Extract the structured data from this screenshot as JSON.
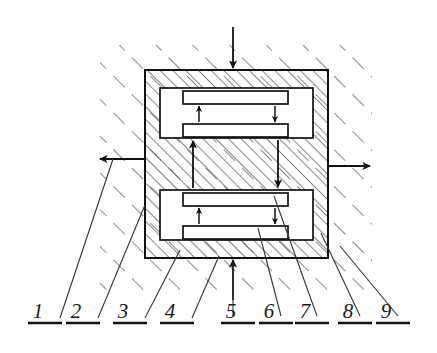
{
  "figure": {
    "type": "technical-cross-section-diagram",
    "background_color": "#ffffff",
    "line_color": "#1a1a1a",
    "hatch_color": "#555555"
  },
  "callouts": [
    {
      "id": "1",
      "label": "1",
      "text_x": 38,
      "text_y": 318,
      "rule_x1": 28,
      "rule_x2": 62,
      "rule_y": 323,
      "leader_x1": 60,
      "leader_y1": 318,
      "leader_x2": 113,
      "leader_y2": 159
    },
    {
      "id": "2",
      "label": "2",
      "text_x": 76,
      "text_y": 318,
      "rule_x1": 66,
      "rule_x2": 100,
      "rule_y": 323,
      "leader_x1": 98,
      "leader_y1": 318,
      "leader_x2": 145,
      "leader_y2": 205
    },
    {
      "id": "3",
      "label": "3",
      "text_x": 123,
      "text_y": 318,
      "rule_x1": 113,
      "rule_x2": 147,
      "rule_y": 323,
      "leader_x1": 145,
      "leader_y1": 318,
      "leader_x2": 180,
      "leader_y2": 250
    },
    {
      "id": "4",
      "label": "4",
      "text_x": 170,
      "text_y": 318,
      "rule_x1": 160,
      "rule_x2": 194,
      "rule_y": 323,
      "leader_x1": 192,
      "leader_y1": 318,
      "leader_x2": 219,
      "leader_y2": 256
    },
    {
      "id": "5",
      "label": "5",
      "text_x": 231,
      "text_y": 318,
      "rule_x1": 221,
      "rule_x2": 255,
      "rule_y": 323,
      "leader_x1": 233,
      "leader_y1": 316,
      "leader_x2": 233,
      "leader_y2": 262
    },
    {
      "id": "6",
      "label": "6",
      "text_x": 269,
      "text_y": 318,
      "rule_x1": 259,
      "rule_x2": 293,
      "rule_y": 323,
      "leader_x1": 281,
      "leader_y1": 316,
      "leader_x2": 258,
      "leader_y2": 228
    },
    {
      "id": "7",
      "label": "7",
      "text_x": 305,
      "text_y": 318,
      "rule_x1": 295,
      "rule_x2": 329,
      "rule_y": 323,
      "leader_x1": 317,
      "leader_y1": 316,
      "leader_x2": 274,
      "leader_y2": 196
    },
    {
      "id": "8",
      "label": "8",
      "text_x": 348,
      "text_y": 318,
      "rule_x1": 338,
      "rule_x2": 372,
      "rule_y": 323,
      "leader_x1": 360,
      "leader_y1": 316,
      "leader_x2": 321,
      "leader_y2": 233
    },
    {
      "id": "9",
      "label": "9",
      "text_x": 386,
      "text_y": 318,
      "rule_x1": 376,
      "rule_x2": 410,
      "rule_y": 323,
      "leader_x1": 398,
      "leader_y1": 316,
      "leader_x2": 340,
      "leader_y2": 246
    }
  ],
  "housing": {
    "outer": {
      "x": 145,
      "y": 70,
      "width": 183,
      "height": 188
    },
    "wall_thickness": 15
  },
  "chambers": [
    {
      "name": "upper-chamber",
      "cavity": {
        "x": 160,
        "y": 88,
        "width": 153,
        "height": 50
      },
      "plates": [
        {
          "name": "upper-chamber-top-plate",
          "x": 183,
          "y": 91,
          "width": 105,
          "height": 13
        },
        {
          "name": "upper-chamber-bottom-plate",
          "x": 183,
          "y": 124,
          "width": 105,
          "height": 13
        }
      ],
      "internal_arrows": [
        {
          "name": "upper-chamber-up-arrow",
          "x": 199,
          "y_from": 122,
          "y_to": 106,
          "direction": "up"
        },
        {
          "name": "upper-chamber-down-arrow",
          "x": 275,
          "y_from": 106,
          "y_to": 122,
          "direction": "down"
        }
      ]
    },
    {
      "name": "lower-chamber",
      "cavity": {
        "x": 160,
        "y": 190,
        "width": 153,
        "height": 50
      },
      "plates": [
        {
          "name": "lower-chamber-top-plate",
          "x": 183,
          "y": 193,
          "width": 105,
          "height": 13
        },
        {
          "name": "lower-chamber-bottom-plate",
          "x": 183,
          "y": 226,
          "width": 105,
          "height": 13
        }
      ],
      "internal_arrows": [
        {
          "name": "lower-chamber-up-arrow",
          "x": 199,
          "y_from": 224,
          "y_to": 208,
          "direction": "up"
        },
        {
          "name": "lower-chamber-down-arrow",
          "x": 275,
          "y_from": 208,
          "y_to": 224,
          "direction": "down"
        }
      ]
    }
  ],
  "flow_arrows": [
    {
      "name": "inlet-arrow-top",
      "direction": "down",
      "x": 233,
      "y_from": 27,
      "y_to": 68
    },
    {
      "name": "inlet-arrow-bottom",
      "direction": "up",
      "x": 233,
      "y_from": 300,
      "y_to": 260
    },
    {
      "name": "outlet-arrow-left",
      "direction": "left",
      "y": 159,
      "x_from": 145,
      "x_to": 98
    },
    {
      "name": "outlet-arrow-right",
      "direction": "right",
      "y": 166,
      "x_from": 328,
      "x_to": 372
    },
    {
      "name": "interchamber-arrow-up",
      "direction": "up",
      "x": 193,
      "y_from": 188,
      "y_to": 140
    },
    {
      "name": "interchamber-arrow-down",
      "direction": "down",
      "x": 278,
      "y_from": 140,
      "y_to": 188
    }
  ]
}
